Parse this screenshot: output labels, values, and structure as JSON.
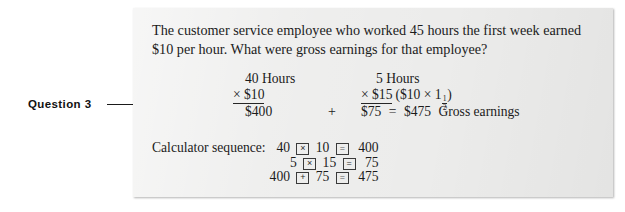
{
  "annotation": {
    "label": "Question 3"
  },
  "question": {
    "text": "The customer service employee who worked 45 hours the first week earned $10 per hour. What were gross earnings for that employee?"
  },
  "solution": {
    "left_column": {
      "header": "40 Hours",
      "operand": "× $10",
      "result": "$400"
    },
    "connector": "+",
    "right_column": {
      "header": "5 Hours",
      "operand": "× $15",
      "paren_open": "($10 × 1",
      "fraction_numerator": "1",
      "fraction_denominator": "2",
      "paren_close": ")",
      "result": "$75",
      "equals": "=",
      "total": "$475",
      "total_label": "Gross earnings"
    }
  },
  "calculator": {
    "label": "Calculator sequence:",
    "rows": [
      {
        "a": "40",
        "key1": "×",
        "b": "10",
        "key2": "=",
        "result": "400"
      },
      {
        "a": "5",
        "key1": "×",
        "b": "15",
        "key2": "=",
        "result": "75"
      },
      {
        "a": "400",
        "key1": "+",
        "b": "75",
        "key2": "=",
        "result": "475"
      }
    ]
  },
  "colors": {
    "panel_background": "#ececeb",
    "page_background": "#ffffff",
    "ink": "#1b1b1b"
  }
}
